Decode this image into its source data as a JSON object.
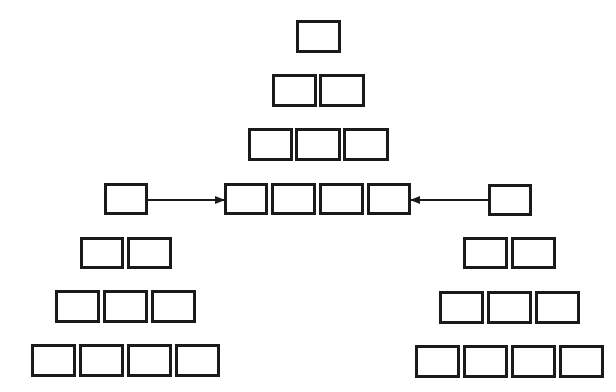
{
  "diagram": {
    "width": 616,
    "height": 392,
    "background": "#ffffff",
    "stroke": "#1a1a1a",
    "stroke_width": 3,
    "box_fill": "#ffffff",
    "groups": [
      {
        "name": "center-pyramid",
        "rows": [
          {
            "y": 20,
            "h": 33,
            "boxes": [
              {
                "x": 296,
                "w": 45
              }
            ]
          },
          {
            "y": 74,
            "h": 33,
            "boxes": [
              {
                "x": 272,
                "w": 45
              },
              {
                "x": 319,
                "w": 46
              }
            ]
          },
          {
            "y": 128,
            "h": 33,
            "boxes": [
              {
                "x": 248,
                "w": 45
              },
              {
                "x": 295,
                "w": 46
              },
              {
                "x": 343,
                "w": 46
              }
            ]
          },
          {
            "y": 183,
            "h": 32,
            "boxes": [
              {
                "x": 224,
                "w": 44
              },
              {
                "x": 271,
                "w": 45
              },
              {
                "x": 319,
                "w": 45
              },
              {
                "x": 367,
                "w": 44
              }
            ]
          }
        ]
      },
      {
        "name": "left-pyramid",
        "rows": [
          {
            "y": 183,
            "h": 32,
            "boxes": [
              {
                "x": 104,
                "w": 44
              }
            ]
          },
          {
            "y": 237,
            "h": 32,
            "boxes": [
              {
                "x": 80,
                "w": 44
              },
              {
                "x": 127,
                "w": 45
              }
            ]
          },
          {
            "y": 290,
            "h": 33,
            "boxes": [
              {
                "x": 55,
                "w": 45
              },
              {
                "x": 103,
                "w": 45
              },
              {
                "x": 151,
                "w": 45
              }
            ]
          },
          {
            "y": 344,
            "h": 33,
            "boxes": [
              {
                "x": 31,
                "w": 45
              },
              {
                "x": 79,
                "w": 45
              },
              {
                "x": 127,
                "w": 45
              },
              {
                "x": 175,
                "w": 45
              }
            ]
          }
        ]
      },
      {
        "name": "right-pyramid",
        "rows": [
          {
            "y": 184,
            "h": 32,
            "boxes": [
              {
                "x": 488,
                "w": 44
              }
            ]
          },
          {
            "y": 237,
            "h": 32,
            "boxes": [
              {
                "x": 463,
                "w": 45
              },
              {
                "x": 511,
                "w": 45
              }
            ]
          },
          {
            "y": 291,
            "h": 33,
            "boxes": [
              {
                "x": 439,
                "w": 45
              },
              {
                "x": 487,
                "w": 45
              },
              {
                "x": 535,
                "w": 45
              }
            ]
          },
          {
            "y": 345,
            "h": 33,
            "boxes": [
              {
                "x": 415,
                "w": 45
              },
              {
                "x": 463,
                "w": 45
              },
              {
                "x": 511,
                "w": 45
              },
              {
                "x": 559,
                "w": 45
              }
            ]
          }
        ]
      }
    ],
    "arrows": [
      {
        "name": "left-to-center-arrow",
        "x1": 148,
        "y1": 200,
        "x2": 224,
        "y2": 200
      },
      {
        "name": "right-to-center-arrow",
        "x1": 488,
        "y1": 200,
        "x2": 411,
        "y2": 200
      }
    ]
  }
}
